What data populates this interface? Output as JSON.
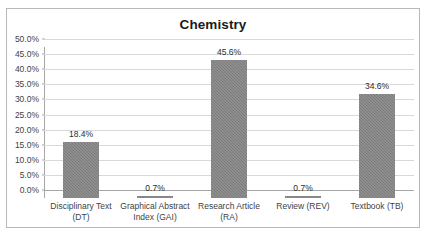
{
  "chart_data": {
    "type": "bar",
    "title": "Chemistry",
    "xlabel": "",
    "ylabel": "",
    "categories": [
      "Disciplinary Text (DT)",
      "Graphical Abstract Index (GAI)",
      "Research Article (RA)",
      "Review (REV)",
      "Textbook (TB)"
    ],
    "category_lines": [
      [
        "Disciplinary Text",
        "(DT)"
      ],
      [
        "Graphical Abstract",
        "Index (GAI)"
      ],
      [
        "Research Article",
        "(RA)"
      ],
      [
        "Review (REV)",
        ""
      ],
      [
        "Textbook (TB)",
        ""
      ]
    ],
    "values": [
      18.4,
      0.7,
      45.6,
      0.7,
      34.6
    ],
    "value_labels": [
      "18.4%",
      "0.7%",
      "45.6%",
      "0.7%",
      "34.6%"
    ],
    "ylim": [
      0,
      50
    ],
    "ytick_values": [
      0,
      5,
      10,
      15,
      20,
      25,
      30,
      35,
      40,
      45,
      50
    ],
    "ytick_labels": [
      "0.0%",
      "5.0%",
      "10.0%",
      "15.0%",
      "20.0%",
      "25.0%",
      "30.0%",
      "35.0%",
      "40.0%",
      "45.0%",
      "50.0%"
    ],
    "grid": true,
    "legend": false,
    "bar_color": "#7b7b7b",
    "gridline_color": "#d9d9d9",
    "axis_color": "#a6a6a6",
    "border_color": "#b8b8b8",
    "text_color": "#3f3f3f",
    "title_color": "#1a1a1a"
  }
}
